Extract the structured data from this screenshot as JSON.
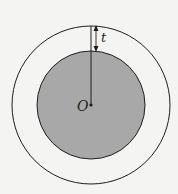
{
  "diagram": {
    "type": "concentric-circles",
    "colors": {
      "background": "#f4f4f2",
      "inner_fill": "#a8a8a8",
      "stroke": "#1e1e1e"
    },
    "center": {
      "x": 91,
      "y": 105
    },
    "outer_circle": {
      "r": 79
    },
    "inner_circle": {
      "r": 54
    },
    "labels": {
      "thickness": "t",
      "center_point": "O"
    }
  }
}
